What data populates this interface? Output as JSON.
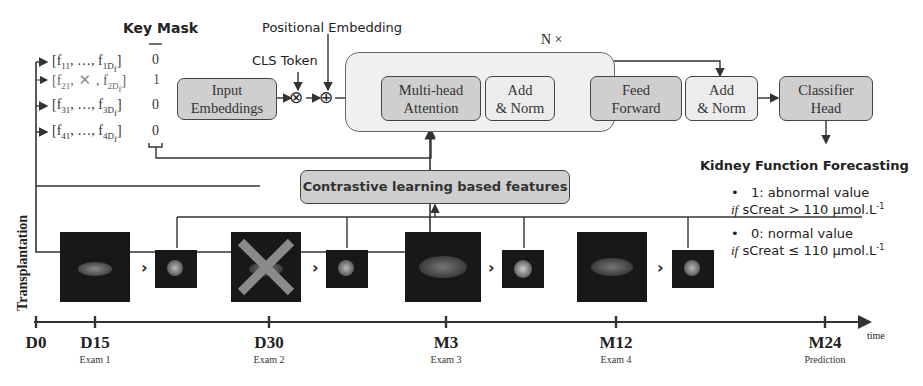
{
  "figure": {
    "key_mask": {
      "title": "Key Mask",
      "rows": [
        {
          "feature": "[f11, …, f1Df]",
          "first_sub": "11",
          "last_sub": "1D",
          "last_subsub": "f",
          "mask": "0",
          "missing": false
        },
        {
          "feature": "[f21, ✕, f2Df]",
          "first_sub": "21",
          "last_sub": "2D",
          "last_subsub": "f",
          "mask": "1",
          "missing": true
        },
        {
          "feature": "[f31, …, f3Df]",
          "first_sub": "31",
          "last_sub": "3D",
          "last_subsub": "f",
          "mask": "0",
          "missing": false
        },
        {
          "feature": "[f41, …, f4Df]",
          "first_sub": "41",
          "last_sub": "4D",
          "last_subsub": "f",
          "mask": "0",
          "missing": false
        }
      ]
    },
    "labels": {
      "positional_embedding": "Positional Embedding",
      "cls_token": "CLS Token",
      "n_times": "N ×",
      "transplantation": "Transplantation",
      "time": "time"
    },
    "blocks": {
      "input_embeddings": [
        "Input",
        "Embeddings"
      ],
      "multi_head_attention": [
        "Multi-head",
        "Attention"
      ],
      "add_norm_1": [
        "Add",
        "& Norm"
      ],
      "feed_forward": [
        "Feed",
        "Forward"
      ],
      "add_norm_2": [
        "Add",
        "& Norm"
      ],
      "classifier_head": [
        "Classifier",
        "Head"
      ],
      "contrastive": "Contrastive learning based features"
    },
    "operators": {
      "multiply": "⊗",
      "add": "⊕"
    },
    "output": {
      "title": "Kidney Function Forecasting",
      "items": [
        {
          "bullet": "•",
          "label": "1: abnormal value",
          "cond_if": "if",
          "cond_text": "sCreat > 110 µmol.L",
          "sup": "-1"
        },
        {
          "bullet": "•",
          "label": "0: normal value",
          "cond_if": "if",
          "cond_text": "sCreat ≤ 110 µmol.L",
          "sup": "-1"
        }
      ]
    },
    "timeline": {
      "ticks": [
        {
          "label": "D0",
          "sub": "",
          "x": 36
        },
        {
          "label": "D15",
          "sub": "Exam 1",
          "x": 95
        },
        {
          "label": "D30",
          "sub": "Exam 2",
          "x": 269
        },
        {
          "label": "M3",
          "sub": "Exam 3",
          "x": 446
        },
        {
          "label": "M12",
          "sub": "Exam 4",
          "x": 616
        },
        {
          "label": "M24",
          "sub": "Prediction",
          "x": 825
        }
      ]
    },
    "exams": [
      {
        "name": "Exam 1",
        "missing": false
      },
      {
        "name": "Exam 2",
        "missing": true
      },
      {
        "name": "Exam 3",
        "missing": false
      },
      {
        "name": "Exam 4",
        "missing": false
      }
    ],
    "colors": {
      "block_dark": "#cfcfcf",
      "block_light": "#ececec",
      "n_block_bg": "#f0f0f0",
      "line": "#333333",
      "missing_cross": "#8a8a8a",
      "scan_bg": "#181818"
    }
  }
}
